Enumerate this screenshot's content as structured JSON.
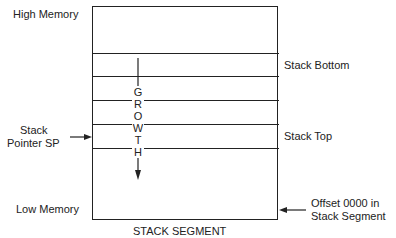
{
  "labels": {
    "high_memory": "High Memory",
    "low_memory": "Low Memory",
    "stack_bottom": "Stack Bottom",
    "stack_top": "Stack Top",
    "stack_pointer_line1": "Stack",
    "stack_pointer_line2": "Pointer SP",
    "offset_line1": "Offset 0000 in",
    "offset_line2": "Stack Segment",
    "caption": "STACK SEGMENT"
  },
  "growth_letters": [
    "G",
    "R",
    "O",
    "W",
    "T",
    "H"
  ],
  "colors": {
    "line": "#222222",
    "background": "#ffffff"
  }
}
